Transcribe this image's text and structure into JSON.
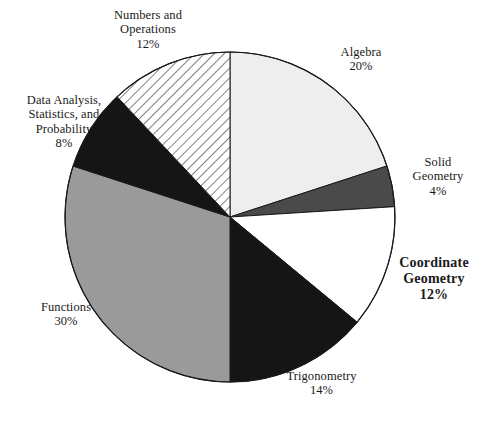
{
  "chart_data": {
    "type": "pie",
    "title": "",
    "subtitle": "",
    "xlabel": "",
    "ylabel": "",
    "legend_position": "none",
    "grid": false,
    "units": "percent",
    "total": 100,
    "start_angle_deg": 0,
    "direction": "clockwise",
    "categories": [
      "Algebra",
      "Solid Geometry",
      "Coordinate Geometry",
      "Trigonometry",
      "Functions",
      "Data Analysis, Statistics, and Probability",
      "Numbers and Operations"
    ],
    "values": [
      20,
      4,
      12,
      14,
      30,
      8,
      12
    ],
    "slices": [
      {
        "id": "algebra",
        "name": "Algebra",
        "name_lines": [
          "Algebra"
        ],
        "value": 20,
        "percent_label": "20%",
        "fill": "#eeeeee",
        "pattern": "solid",
        "emphasis": false
      },
      {
        "id": "solid-geometry",
        "name": "Solid Geometry",
        "name_lines": [
          "Solid",
          "Geometry"
        ],
        "value": 4,
        "percent_label": "4%",
        "fill": "#4a4a4a",
        "pattern": "solid",
        "emphasis": false
      },
      {
        "id": "coordinate-geometry",
        "name": "Coordinate Geometry",
        "name_lines": [
          "Coordinate",
          "Geometry"
        ],
        "value": 12,
        "percent_label": "12%",
        "fill": "#ffffff",
        "pattern": "solid",
        "emphasis": true
      },
      {
        "id": "trigonometry",
        "name": "Trigonometry",
        "name_lines": [
          "Trigonometry"
        ],
        "value": 14,
        "percent_label": "14%",
        "fill": "#151515",
        "pattern": "solid",
        "emphasis": false
      },
      {
        "id": "functions",
        "name": "Functions",
        "name_lines": [
          "Functions"
        ],
        "value": 30,
        "percent_label": "30%",
        "fill": "#9a9a9a",
        "pattern": "solid",
        "emphasis": false
      },
      {
        "id": "data-analysis",
        "name": "Data Analysis, Statistics, and Probability",
        "name_lines": [
          "Data Analysis,",
          "Statistics, and",
          "Probability"
        ],
        "value": 8,
        "percent_label": "8%",
        "fill": "#151515",
        "pattern": "solid",
        "emphasis": false
      },
      {
        "id": "numbers-operations",
        "name": "Numbers and Operations",
        "name_lines": [
          "Numbers and",
          "Operations"
        ],
        "value": 12,
        "percent_label": "12%",
        "fill": "#ffffff",
        "pattern": "diagonal-hatch",
        "emphasis": false
      }
    ],
    "colors": {
      "outline": "#1a1a1a",
      "background": "#ffffff",
      "light_gray": "#eeeeee",
      "mid_gray": "#9a9a9a",
      "dark_gray": "#4a4a4a",
      "black": "#151515"
    }
  }
}
